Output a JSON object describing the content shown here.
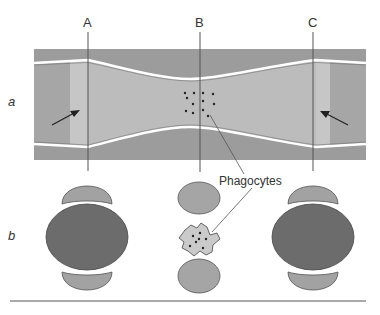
{
  "labels": {
    "section_lines": [
      "A",
      "B",
      "C"
    ],
    "row_a": "a",
    "row_b": "b",
    "callout": "Phagocytes"
  },
  "colors": {
    "outer_wall": "#9a9a9a",
    "lumen_dark": "#a8a8a8",
    "lumen_light": "#c4c4c4",
    "lumen_mid": "#b9b9b9",
    "cell_dark": "#6e6e6e",
    "cell_light": "#a5a5a5",
    "phagocyte": "#c8c8c8",
    "line": "#555555"
  }
}
